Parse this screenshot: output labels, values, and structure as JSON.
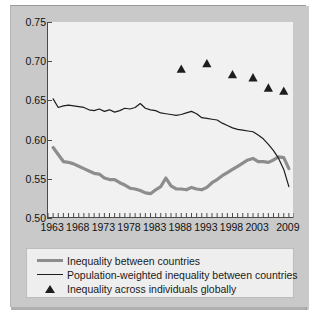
{
  "chart_data": {
    "type": "line",
    "title": "",
    "xlabel": "",
    "ylabel": "",
    "xlim": [
      1962,
      2010
    ],
    "ylim": [
      0.5,
      0.75
    ],
    "grid": false,
    "legend_position": "bottom",
    "yticks": [
      "0.75",
      "0.70",
      "0.65",
      "0.60",
      "0.55",
      "0.50"
    ],
    "ytick_values": [
      0.75,
      0.7,
      0.65,
      0.6,
      0.55,
      0.5
    ],
    "xticks": [
      "1963",
      "1968",
      "1973",
      "1978",
      "1983",
      "1988",
      "1993",
      "1998",
      "2003",
      "2009"
    ],
    "xtick_values": [
      1963,
      1968,
      1973,
      1978,
      1983,
      1988,
      1993,
      1998,
      2003,
      2009
    ],
    "x": [
      1963,
      1964,
      1965,
      1966,
      1967,
      1968,
      1969,
      1970,
      1971,
      1972,
      1973,
      1974,
      1975,
      1976,
      1977,
      1978,
      1979,
      1980,
      1981,
      1982,
      1983,
      1984,
      1985,
      1986,
      1987,
      1988,
      1989,
      1990,
      1991,
      1992,
      1993,
      1994,
      1995,
      1996,
      1997,
      1998,
      1999,
      2000,
      2001,
      2002,
      2003,
      2004,
      2005,
      2006,
      2007,
      2008,
      2009
    ],
    "series": [
      {
        "name": "Inequality between countries",
        "color": "#8d8d8d",
        "style": "thick-line",
        "values": [
          0.59,
          0.581,
          0.572,
          0.571,
          0.569,
          0.566,
          0.563,
          0.56,
          0.557,
          0.556,
          0.551,
          0.549,
          0.549,
          0.545,
          0.542,
          0.538,
          0.537,
          0.535,
          0.532,
          0.531,
          0.536,
          0.54,
          0.551,
          0.541,
          0.537,
          0.537,
          0.536,
          0.539,
          0.537,
          0.536,
          0.539,
          0.545,
          0.549,
          0.554,
          0.558,
          0.562,
          0.566,
          0.57,
          0.574,
          0.576,
          0.572,
          0.572,
          0.571,
          0.574,
          0.578,
          0.577,
          0.563
        ]
      },
      {
        "name": "Population-weighted inequality between countries",
        "color": "#1d1d1d",
        "style": "thin-line",
        "values": [
          0.652,
          0.641,
          0.643,
          0.644,
          0.643,
          0.642,
          0.641,
          0.638,
          0.637,
          0.639,
          0.636,
          0.638,
          0.635,
          0.637,
          0.64,
          0.639,
          0.641,
          0.646,
          0.64,
          0.638,
          0.637,
          0.634,
          0.633,
          0.632,
          0.631,
          0.632,
          0.634,
          0.636,
          0.633,
          0.628,
          0.627,
          0.626,
          0.625,
          0.621,
          0.618,
          0.615,
          0.613,
          0.612,
          0.611,
          0.61,
          0.606,
          0.601,
          0.594,
          0.586,
          0.576,
          0.562,
          0.54
        ]
      }
    ],
    "scatter": {
      "name": "Inequality across individuals globally",
      "color": "#1d1d1d",
      "marker": "triangle",
      "points": [
        {
          "x": 1988,
          "y": 0.69
        },
        {
          "x": 1993,
          "y": 0.697
        },
        {
          "x": 1998,
          "y": 0.683
        },
        {
          "x": 2002,
          "y": 0.679
        },
        {
          "x": 2005,
          "y": 0.666
        },
        {
          "x": 2008,
          "y": 0.662
        }
      ]
    }
  },
  "legend": {
    "items": [
      {
        "label": "Inequality between countries",
        "key": "thick-line-key"
      },
      {
        "label": "Population-weighted inequality between countries",
        "key": "thin-line-key"
      },
      {
        "label": "Inequality across individuals globally",
        "key": "triangle-key"
      }
    ]
  },
  "colors": {
    "panel_background": "#c9c9c9",
    "plot_background": "#f1f1f1",
    "axis": "#4a4a4a",
    "series_thick": "#8d8d8d",
    "series_thin": "#1d1d1d",
    "marker": "#1d1d1d"
  }
}
